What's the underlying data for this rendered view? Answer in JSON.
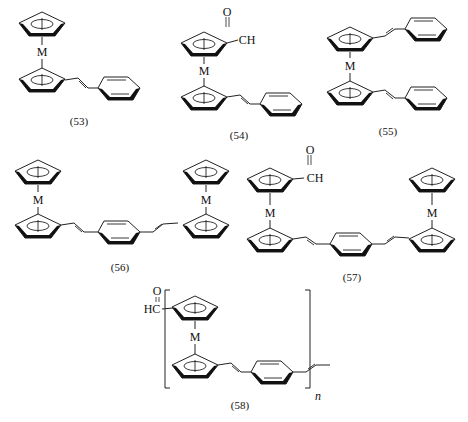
{
  "figure": {
    "metal_symbol": "M",
    "formyl": {
      "oxygen": "O",
      "ch_right": "CH",
      "ch_left": "HC",
      "double_bond": "="
    },
    "polymer_subscript": "n"
  },
  "compounds": [
    {
      "id": "53",
      "label": "(53)",
      "name": "metallocene with one styryl group"
    },
    {
      "id": "54",
      "label": "(54)",
      "name": "formyl metallocene with one styryl group"
    },
    {
      "id": "55",
      "label": "(55)",
      "name": "metallocene with two styryl groups"
    },
    {
      "id": "56",
      "label": "(56)",
      "name": "bis-metallocene bridged by 1,4-divinylbenzene"
    },
    {
      "id": "57",
      "label": "(57)",
      "name": "formyl bis-metallocene bridged by 1,4-divinylbenzene"
    },
    {
      "id": "58",
      "label": "(58)",
      "name": "formyl metallocene vinylene-phenylene polymer"
    }
  ]
}
